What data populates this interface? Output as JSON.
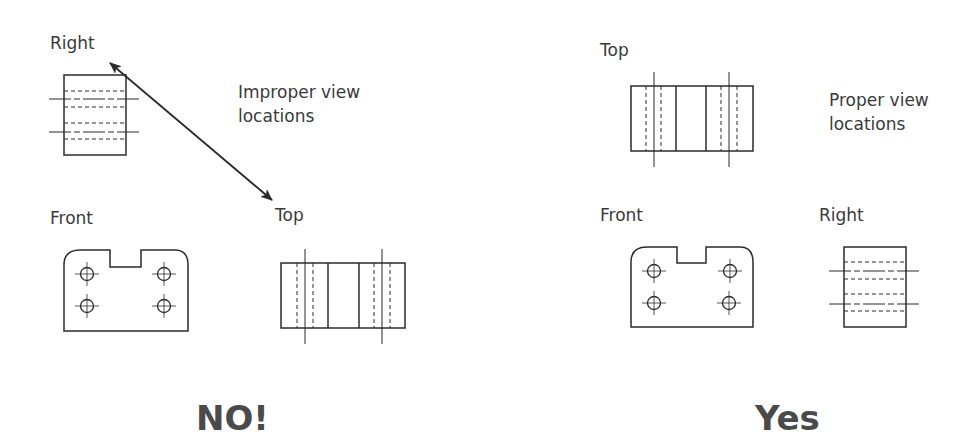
{
  "left_panel": {
    "labels": {
      "right": "Right",
      "front": "Front",
      "top": "Top"
    },
    "note_line1": "Improper view",
    "note_line2": "locations",
    "verdict": "NO!"
  },
  "right_panel": {
    "labels": {
      "top": "Top",
      "front": "Front",
      "right": "Right"
    },
    "note_line1": "Proper view",
    "note_line2": "locations",
    "verdict": "Yes"
  },
  "colors": {
    "line": "#2b2b2b",
    "text": "#3a3a3a",
    "verdict": "#4a4a4a"
  }
}
